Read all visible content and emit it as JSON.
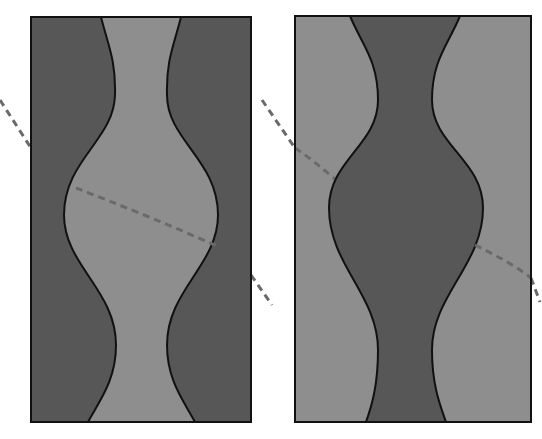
{
  "figure": {
    "colors": {
      "background": "#ffffff",
      "light_fill": "#8e8e8e",
      "dark_fill": "#575757",
      "outline": "#111111",
      "dash": "#6a6a6a"
    },
    "panels": [
      {
        "name": "left-panel",
        "rect": {
          "x": 31,
          "y": 17,
          "w": 220,
          "h": 405
        },
        "background_fill": "dark",
        "inner_shape_fill": "light"
      },
      {
        "name": "right-panel",
        "rect": {
          "x": 295,
          "y": 16,
          "w": 236,
          "h": 406
        },
        "background_fill": "light",
        "inner_shape_fill": "dark"
      }
    ]
  }
}
